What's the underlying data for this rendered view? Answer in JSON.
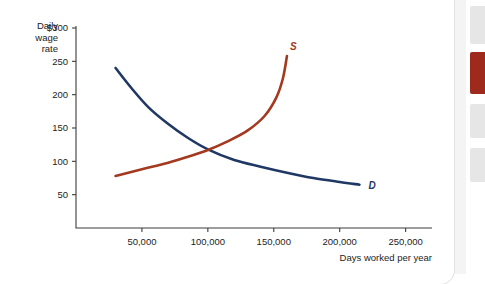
{
  "card": {
    "background_color": "#ffffff",
    "page_background_color": "#f4f4f4"
  },
  "side_rail": {
    "blocks": [
      {
        "name": "rail-block-gray-top",
        "color": "#e6e6e6",
        "top": 6,
        "height": 38
      },
      {
        "name": "rail-block-red",
        "color": "#9e2a1e",
        "top": 52,
        "height": 42
      },
      {
        "name": "rail-block-gray-middle",
        "color": "#e6e6e6",
        "top": 104,
        "height": 34
      },
      {
        "name": "rail-block-gray-bottom",
        "color": "#e6e6e6",
        "top": 148,
        "height": 34
      }
    ]
  },
  "chart_data": {
    "type": "line",
    "title": "",
    "xlabel": "Days worked per year",
    "ylabel_lines": [
      "Daily",
      "wage",
      "rate"
    ],
    "xlim": [
      0,
      270000
    ],
    "ylim": [
      0,
      300
    ],
    "grid": false,
    "legend_position": "inline-curve-labels",
    "x_ticks": [
      {
        "value": 50000,
        "label": "50,000"
      },
      {
        "value": 100000,
        "label": "100,000"
      },
      {
        "value": 150000,
        "label": "150,000"
      },
      {
        "value": 200000,
        "label": "200,000"
      },
      {
        "value": 250000,
        "label": "250,000"
      }
    ],
    "y_ticks": [
      {
        "value": 50,
        "label": "50"
      },
      {
        "value": 100,
        "label": "100"
      },
      {
        "value": 150,
        "label": "150"
      },
      {
        "value": 200,
        "label": "200"
      },
      {
        "value": 250,
        "label": "250"
      },
      {
        "value": 300,
        "label": "$300"
      }
    ],
    "series": [
      {
        "name": "Demand",
        "label": "D",
        "color": "#1f3864",
        "label_color": "#1f3864",
        "points": [
          {
            "x": 30000,
            "y": 240
          },
          {
            "x": 42000,
            "y": 210
          },
          {
            "x": 55000,
            "y": 181
          },
          {
            "x": 70000,
            "y": 156
          },
          {
            "x": 85000,
            "y": 135
          },
          {
            "x": 100000,
            "y": 118
          },
          {
            "x": 120000,
            "y": 102
          },
          {
            "x": 140000,
            "y": 92
          },
          {
            "x": 160000,
            "y": 83
          },
          {
            "x": 180000,
            "y": 75
          },
          {
            "x": 200000,
            "y": 69
          },
          {
            "x": 215000,
            "y": 65
          }
        ]
      },
      {
        "name": "Supply",
        "label": "S",
        "color": "#a33a20",
        "label_color": "#a33a20",
        "points": [
          {
            "x": 30000,
            "y": 78
          },
          {
            "x": 50000,
            "y": 88
          },
          {
            "x": 70000,
            "y": 98
          },
          {
            "x": 85000,
            "y": 107
          },
          {
            "x": 100000,
            "y": 117
          },
          {
            "x": 115000,
            "y": 130
          },
          {
            "x": 130000,
            "y": 146
          },
          {
            "x": 143000,
            "y": 168
          },
          {
            "x": 152000,
            "y": 196
          },
          {
            "x": 157000,
            "y": 225
          },
          {
            "x": 160000,
            "y": 258
          }
        ]
      }
    ],
    "equilibrium": {
      "x": 100000,
      "y": 117
    }
  }
}
